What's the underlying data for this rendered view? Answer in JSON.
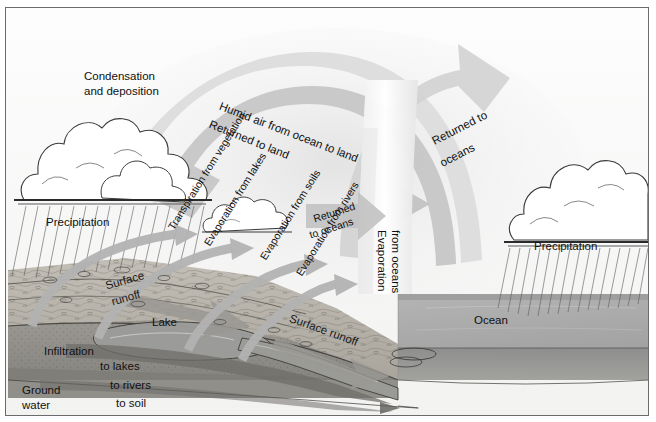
{
  "diagram": {
    "frame_border_color": "#6b6b6b",
    "sky_color": "#fbfbfb",
    "arrow_fill": "#c9c9c9",
    "arrow_fill_light": "#dedede",
    "ocean_color": "#a8a8a8",
    "land_color": "#b9b5ad",
    "groundwater_color": "#8f8d88",
    "text_color": "#111111"
  },
  "labels": {
    "condensation": "Condensation\nand deposition",
    "condensation_line1": "Condensation",
    "condensation_line2": "and deposition",
    "precipitation_left": "Precipitation",
    "precipitation_right": "Precipitation",
    "humid_air": "Humid air from ocean to land",
    "returned_to_land": "Returned to land",
    "returned_to_oceans_upper_l1": "Returned to",
    "returned_to_oceans_upper_l2": "oceans",
    "transpiration_vegetation": "Transpiration from vegetation",
    "evaporation_lakes": "Evaporation from lakes",
    "evaporation_soils": "Evaporation from soils",
    "evaporation_rivers": "Evaporation from rivers",
    "returned_to_oceans_mid_l1": "Returned",
    "returned_to_oceans_mid_l2": "to oceans",
    "evaporation_oceans_l1": "Evaporation",
    "evaporation_oceans_l2": "from oceans",
    "surface_runoff_upper_l1": "Surface",
    "surface_runoff_upper_l2": "runoff",
    "surface_runoff_lower": "Surface runoff",
    "lake": "Lake",
    "ocean": "Ocean",
    "infiltration": "Infiltration",
    "ground_water_l1": "Ground",
    "ground_water_l2": "water",
    "to_lakes": "to lakes",
    "to_rivers": "to rivers",
    "to_soil": "to soil",
    "to_oceans": "to oceans"
  },
  "processes": [
    {
      "name": "condensation-and-deposition",
      "label": "Condensation and deposition"
    },
    {
      "name": "precipitation",
      "label": "Precipitation"
    },
    {
      "name": "humid-air-transport",
      "label": "Humid air from ocean to land"
    },
    {
      "name": "returned-to-land",
      "label": "Returned to land"
    },
    {
      "name": "returned-to-oceans",
      "label": "Returned to oceans"
    },
    {
      "name": "transpiration-from-vegetation",
      "label": "Transpiration from vegetation"
    },
    {
      "name": "evaporation-from-lakes",
      "label": "Evaporation from lakes"
    },
    {
      "name": "evaporation-from-soils",
      "label": "Evaporation from soils"
    },
    {
      "name": "evaporation-from-rivers",
      "label": "Evaporation from rivers"
    },
    {
      "name": "evaporation-from-oceans",
      "label": "Evaporation from oceans"
    },
    {
      "name": "surface-runoff",
      "label": "Surface runoff"
    },
    {
      "name": "infiltration",
      "label": "Infiltration"
    },
    {
      "name": "ground-water-flow",
      "label": "Ground water"
    }
  ],
  "reservoirs": [
    {
      "name": "lake",
      "label": "Lake"
    },
    {
      "name": "ocean",
      "label": "Ocean"
    },
    {
      "name": "ground-water",
      "label": "Ground water"
    }
  ],
  "groundwater_destinations": [
    "to lakes",
    "to rivers",
    "to soil",
    "to oceans"
  ]
}
